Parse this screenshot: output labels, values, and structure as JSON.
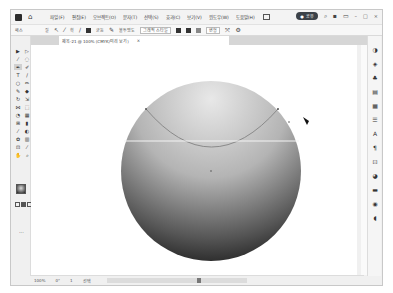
{
  "app": {
    "title": "Illustrator",
    "menu": [
      "파일(F)",
      "편집(E)",
      "오브젝트(O)",
      "문자(T)",
      "선택(S)",
      "효과(C)",
      "보기(V)",
      "윈도우(W)",
      "도움말(H)"
    ],
    "share_label": "공유",
    "window_controls": [
      "minimize",
      "maximize",
      "close"
    ]
  },
  "control_bar": {
    "selection_label": "패스",
    "fill_label": "칠",
    "stroke_label": "획",
    "uniform_label": "균등",
    "opacity_label": "불투명도",
    "style_label": "그래픽 스타일",
    "transform_label": "변형"
  },
  "document": {
    "tab_title": "제목-21 @ 100% (CMYK/미리 보기)",
    "tab_close": "×"
  },
  "toolbar": {
    "tools": [
      "selection",
      "direct-selection",
      "magic-wand",
      "lasso",
      "pen",
      "curvature",
      "type",
      "line",
      "ellipse",
      "paintbrush",
      "pencil",
      "eraser",
      "rotate",
      "scale",
      "width",
      "free-transform",
      "shape-builder",
      "perspective",
      "mesh",
      "gradient",
      "eyedropper",
      "blend",
      "symbol-sprayer",
      "column-graph",
      "artboard",
      "slice",
      "hand",
      "zoom"
    ],
    "more_label": "..."
  },
  "right_panel": {
    "icons": [
      "properties",
      "layers",
      "libraries",
      "appearance",
      "swatches",
      "align",
      "character",
      "paragraph",
      "transform",
      "color",
      "stroke",
      "gradient",
      "transparency"
    ]
  },
  "status": {
    "zoom": "100%",
    "rotation": "0°",
    "artboard": "1",
    "mode": "선택"
  },
  "colors": {
    "window_bg": "#f0f0f0",
    "canvas_bg": "#ffffff",
    "accent_dark": "#3b4148"
  }
}
